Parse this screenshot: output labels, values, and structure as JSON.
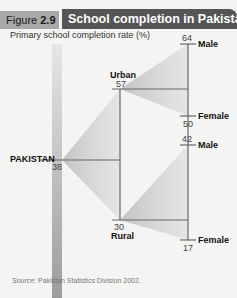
{
  "header": {
    "figure_label": "Figure",
    "figure_number": "2.9",
    "title": "School completion in Pakistan"
  },
  "subtitle": "Primary school completion rate (%)",
  "nodes": {
    "pakistan": {
      "label": "PAKISTAN",
      "value": "38"
    },
    "urban": {
      "label": "Urban",
      "value": "57"
    },
    "rural": {
      "label": "Rural",
      "value": "30"
    },
    "urban_male": {
      "label": "Male",
      "value": "64"
    },
    "urban_female": {
      "label": "Female",
      "value": "50"
    },
    "rural_male": {
      "label": "Male",
      "value": "42"
    },
    "rural_female": {
      "label": "Female",
      "value": "17"
    }
  },
  "colors": {
    "header_title_bg": "#555555",
    "header_figure_bg": "#a8a8a8",
    "line": "#666666",
    "wedge": "#c8c8c8"
  },
  "source": {
    "prefix": "Source:",
    "text": "Pakistan Statistics Division 2002."
  }
}
